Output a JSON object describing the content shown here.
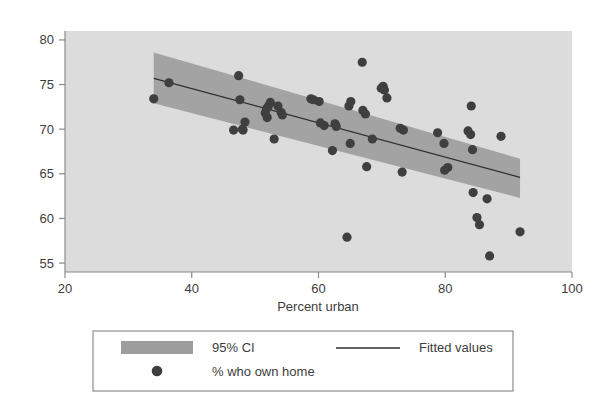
{
  "chart_data": {
    "type": "scatter",
    "title": "",
    "subtitle": "",
    "xlabel": "Percent urban",
    "ylabel": "",
    "xlim": [
      20,
      100
    ],
    "ylim": [
      54,
      81
    ],
    "grid": false,
    "legend_position": "bottom",
    "x_ticks": [
      20,
      40,
      60,
      80,
      100
    ],
    "x_tick_labels": [
      "20",
      "40",
      "60",
      "80",
      "100"
    ],
    "y_ticks": [
      55,
      60,
      65,
      70,
      75,
      80
    ],
    "y_tick_labels": [
      "55",
      "60",
      "65",
      "70",
      "75",
      "80"
    ],
    "series": [
      {
        "name": "% who own home",
        "marker": "circle",
        "points": [
          [
            34.0,
            73.4
          ],
          [
            36.4,
            75.2
          ],
          [
            46.6,
            69.9
          ],
          [
            47.4,
            76.0
          ],
          [
            47.6,
            73.3
          ],
          [
            48.0,
            70.0
          ],
          [
            48.1,
            69.9
          ],
          [
            48.4,
            70.8
          ],
          [
            51.6,
            71.8
          ],
          [
            51.8,
            72.3
          ],
          [
            51.9,
            71.3
          ],
          [
            52.1,
            72.6
          ],
          [
            52.4,
            73.0
          ],
          [
            53.0,
            68.9
          ],
          [
            53.6,
            72.6
          ],
          [
            54.1,
            71.9
          ],
          [
            54.3,
            71.6
          ],
          [
            58.8,
            73.4
          ],
          [
            59.2,
            73.3
          ],
          [
            60.1,
            73.1
          ],
          [
            60.3,
            70.7
          ],
          [
            60.9,
            70.4
          ],
          [
            62.2,
            67.6
          ],
          [
            62.6,
            70.6
          ],
          [
            62.8,
            70.3
          ],
          [
            64.5,
            57.9
          ],
          [
            64.8,
            72.6
          ],
          [
            65.0,
            68.4
          ],
          [
            65.1,
            73.1
          ],
          [
            66.9,
            77.5
          ],
          [
            67.0,
            72.1
          ],
          [
            67.4,
            71.7
          ],
          [
            67.6,
            65.8
          ],
          [
            68.5,
            68.9
          ],
          [
            69.9,
            74.6
          ],
          [
            70.2,
            74.8
          ],
          [
            70.4,
            74.4
          ],
          [
            70.8,
            73.5
          ],
          [
            72.9,
            70.1
          ],
          [
            73.2,
            65.2
          ],
          [
            73.4,
            69.9
          ],
          [
            78.8,
            69.6
          ],
          [
            79.8,
            68.4
          ],
          [
            79.9,
            65.4
          ],
          [
            80.4,
            65.7
          ],
          [
            83.6,
            69.8
          ],
          [
            84.0,
            69.4
          ],
          [
            84.1,
            72.6
          ],
          [
            84.3,
            67.7
          ],
          [
            84.4,
            62.9
          ],
          [
            85.0,
            60.1
          ],
          [
            85.4,
            59.3
          ],
          [
            86.6,
            62.2
          ],
          [
            87.0,
            55.8
          ],
          [
            88.8,
            69.2
          ],
          [
            91.8,
            58.5
          ]
        ]
      }
    ],
    "fit_line": {
      "name": "Fitted values",
      "x_start": 34.0,
      "y_start": 75.7,
      "x_end": 91.8,
      "y_end": 64.6
    },
    "ci_band": {
      "name": "95% CI",
      "x_start": 34.0,
      "x_end": 91.8,
      "upper_start": 78.6,
      "lower_start": 72.9,
      "upper_end": 66.7,
      "lower_end": 62.3
    },
    "colors": {
      "plot_background": "#dcdcdc",
      "ci_band": "#9d9d9d",
      "fit_line": "#2e2e2e",
      "marker": "#3f3f3f",
      "axis": "#8a8a8a",
      "text": "#3d3d3d",
      "legend_border": "#8d8d8d"
    }
  },
  "legend": {
    "entries": [
      {
        "label": "95% CI",
        "glyph": "band-swatch"
      },
      {
        "label": "Fitted values",
        "glyph": "line-swatch"
      },
      {
        "label": "% who own home",
        "glyph": "dot-swatch"
      }
    ]
  }
}
